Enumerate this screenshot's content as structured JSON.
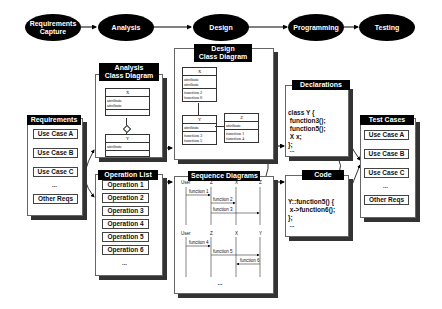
{
  "process": [
    {
      "label": "Requirements Capture"
    },
    {
      "label": "Analysis"
    },
    {
      "label": "Design"
    },
    {
      "label": "Programming"
    },
    {
      "label": "Testing"
    }
  ],
  "requirements": {
    "title": "Requirements",
    "items": [
      "Use Case A",
      "Use Case B",
      "Use Case C",
      "...",
      "Other Reqs"
    ]
  },
  "analysis_class": {
    "title_line1": "Analysis",
    "title_line2": "Class Diagram",
    "class_x": {
      "name": "X",
      "attributes": [
        "attribute",
        "attribute"
      ]
    },
    "class_y": {
      "name": "Y",
      "attributes": [
        "attribute"
      ]
    }
  },
  "operation_list": {
    "title": "Operation List",
    "items": [
      "Operation 1",
      "Operation 2",
      "Operation 3",
      "Operation 4",
      "Operation 5",
      "Operation 6"
    ],
    "ellipsis": "..."
  },
  "design_class": {
    "title_line1": "Design",
    "title_line2": "Class Diagram",
    "class_x": {
      "name": "X",
      "attributes": [
        "attribute",
        "attribute"
      ],
      "functions": [
        "function 2",
        "function 6"
      ]
    },
    "class_y": {
      "name": "Y",
      "attributes": [
        "attribute"
      ],
      "functions": [
        "function 3",
        "function 5"
      ]
    },
    "class_z": {
      "name": "Z",
      "attributes": [
        "attribute"
      ],
      "functions": [
        "function 1",
        "function 4"
      ]
    }
  },
  "sequence": {
    "title": "Sequence Diagrams",
    "diagram1": {
      "lifelines": [
        "User",
        "Z",
        "X",
        "Z"
      ],
      "messages": [
        "function 1",
        "function 2",
        "function 3"
      ]
    },
    "diagram2": {
      "lifelines": [
        "User",
        "Z",
        "X",
        "Y"
      ],
      "messages": [
        "function 4",
        "function 5",
        "function 6"
      ]
    },
    "ellipsis": "..."
  },
  "declarations": {
    "title": "Declarations",
    "code": [
      "class Y {",
      " function3();",
      " function5();",
      " X x;",
      "};"
    ],
    "ellipsis": "..."
  },
  "code": {
    "title": "Code",
    "code": [
      "Y::function5() {",
      " x->function6();",
      "};"
    ],
    "ellipsis": "..."
  },
  "test_cases": {
    "title": "Test Cases",
    "items": [
      "Use Case A",
      "Use Case B",
      "Use Case C",
      "...",
      "Other Reqs"
    ]
  }
}
